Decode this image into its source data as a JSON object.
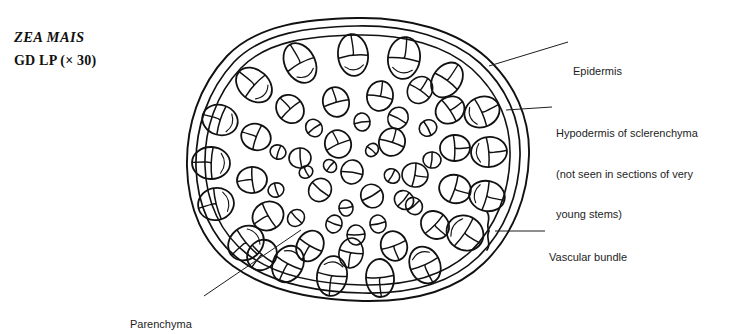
{
  "figure": {
    "title_species": "ZEA MAIS",
    "title_subtitle": "GD LP (× 30)",
    "background_color": "#ffffff",
    "ink_color": "#111111",
    "view": {
      "width": 737,
      "height": 329
    }
  },
  "labels": {
    "epidermis": "Epidermis",
    "hypodermis_line1": "Hypodermis of sclerenchyma",
    "hypodermis_line2": "(not seen in sections of very",
    "hypodermis_line3": "young stems)",
    "vascular_bundle": "Vascular bundle",
    "parenchyma": "Parenchyma"
  },
  "diagram": {
    "type": "botanical-cross-section",
    "outline_rings": 3,
    "bundle_count": 57,
    "outline_center": {
      "cx": 358,
      "cy": 159
    },
    "outline_radii": {
      "rx": 168,
      "ry": 141
    },
    "bundles": [
      {
        "x": 300,
        "y": 63,
        "rx": 15,
        "ry": 21,
        "rot": -28
      },
      {
        "x": 353,
        "y": 55,
        "rx": 15,
        "ry": 21,
        "rot": -6
      },
      {
        "x": 404,
        "y": 58,
        "rx": 16,
        "ry": 21,
        "rot": 8
      },
      {
        "x": 254,
        "y": 85,
        "rx": 15,
        "ry": 20,
        "rot": -48
      },
      {
        "x": 447,
        "y": 80,
        "rx": 14,
        "ry": 19,
        "rot": 36
      },
      {
        "x": 220,
        "y": 120,
        "rx": 15,
        "ry": 18,
        "rot": -72
      },
      {
        "x": 482,
        "y": 112,
        "rx": 15,
        "ry": 18,
        "rot": 66
      },
      {
        "x": 211,
        "y": 163,
        "rx": 16,
        "ry": 19,
        "rot": -88
      },
      {
        "x": 489,
        "y": 152,
        "rx": 15,
        "ry": 18,
        "rot": 85
      },
      {
        "x": 216,
        "y": 204,
        "rx": 16,
        "ry": 18,
        "rot": -104
      },
      {
        "x": 487,
        "y": 196,
        "rx": 15,
        "ry": 18,
        "rot": 104
      },
      {
        "x": 246,
        "y": 243,
        "rx": 16,
        "ry": 19,
        "rot": -130
      },
      {
        "x": 465,
        "y": 233,
        "rx": 17,
        "ry": 19,
        "rot": 124
      },
      {
        "x": 288,
        "y": 264,
        "rx": 15,
        "ry": 19,
        "rot": -152
      },
      {
        "x": 332,
        "y": 276,
        "rx": 15,
        "ry": 20,
        "rot": -172
      },
      {
        "x": 380,
        "y": 278,
        "rx": 14,
        "ry": 19,
        "rot": 176
      },
      {
        "x": 425,
        "y": 265,
        "rx": 15,
        "ry": 19,
        "rot": 156
      },
      {
        "x": 268,
        "y": 216,
        "rx": 14,
        "ry": 16,
        "rot": -120
      },
      {
        "x": 310,
        "y": 246,
        "rx": 13,
        "ry": 16,
        "rot": -150
      },
      {
        "x": 351,
        "y": 253,
        "rx": 12,
        "ry": 15,
        "rot": -170
      },
      {
        "x": 394,
        "y": 246,
        "rx": 13,
        "ry": 15,
        "rot": 160
      },
      {
        "x": 435,
        "y": 225,
        "rx": 13,
        "ry": 15,
        "rot": 134
      },
      {
        "x": 455,
        "y": 189,
        "rx": 14,
        "ry": 16,
        "rot": 108
      },
      {
        "x": 455,
        "y": 148,
        "rx": 13,
        "ry": 15,
        "rot": 88
      },
      {
        "x": 450,
        "y": 110,
        "rx": 13,
        "ry": 15,
        "rot": 56
      },
      {
        "x": 420,
        "y": 90,
        "rx": 12,
        "ry": 14,
        "rot": 34
      },
      {
        "x": 380,
        "y": 96,
        "rx": 13,
        "ry": 15,
        "rot": 10
      },
      {
        "x": 336,
        "y": 102,
        "rx": 13,
        "ry": 15,
        "rot": -16
      },
      {
        "x": 290,
        "y": 109,
        "rx": 13,
        "ry": 15,
        "rot": -42
      },
      {
        "x": 256,
        "y": 137,
        "rx": 13,
        "ry": 15,
        "rot": -70
      },
      {
        "x": 252,
        "y": 180,
        "rx": 13,
        "ry": 15,
        "rot": -96
      },
      {
        "x": 338,
        "y": 144,
        "rx": 13,
        "ry": 14,
        "rot": -24
      },
      {
        "x": 392,
        "y": 142,
        "rx": 13,
        "ry": 14,
        "rot": 18
      },
      {
        "x": 415,
        "y": 175,
        "rx": 12,
        "ry": 13,
        "rot": 100
      },
      {
        "x": 372,
        "y": 196,
        "rx": 11,
        "ry": 12,
        "rot": 150
      },
      {
        "x": 320,
        "y": 190,
        "rx": 11,
        "ry": 12,
        "rot": -140
      },
      {
        "x": 300,
        "y": 158,
        "rx": 10,
        "ry": 11,
        "rot": -95
      },
      {
        "x": 352,
        "y": 172,
        "rx": 11,
        "ry": 12,
        "rot": 8
      },
      {
        "x": 398,
        "y": 118,
        "rx": 10,
        "ry": 11,
        "rot": 28
      },
      {
        "x": 362,
        "y": 122,
        "rx": 8,
        "ry": 9,
        "rot": -8
      },
      {
        "x": 314,
        "y": 128,
        "rx": 8,
        "ry": 9,
        "rot": -36
      },
      {
        "x": 278,
        "y": 152,
        "rx": 7,
        "ry": 8,
        "rot": -72
      },
      {
        "x": 276,
        "y": 190,
        "rx": 7,
        "ry": 8,
        "rot": -108
      },
      {
        "x": 296,
        "y": 218,
        "rx": 8,
        "ry": 9,
        "rot": -134
      },
      {
        "x": 334,
        "y": 224,
        "rx": 8,
        "ry": 9,
        "rot": -160
      },
      {
        "x": 378,
        "y": 224,
        "rx": 8,
        "ry": 9,
        "rot": 168
      },
      {
        "x": 414,
        "y": 206,
        "rx": 8,
        "ry": 9,
        "rot": 140
      },
      {
        "x": 432,
        "y": 160,
        "rx": 8,
        "ry": 9,
        "rot": 96
      },
      {
        "x": 428,
        "y": 128,
        "rx": 8,
        "ry": 9,
        "rot": 62
      },
      {
        "x": 392,
        "y": 176,
        "rx": 7,
        "ry": 8,
        "rot": 120
      },
      {
        "x": 346,
        "y": 208,
        "rx": 7,
        "ry": 8,
        "rot": 172
      },
      {
        "x": 306,
        "y": 172,
        "rx": 6,
        "ry": 7,
        "rot": -118
      },
      {
        "x": 330,
        "y": 166,
        "rx": 6,
        "ry": 7,
        "rot": -50
      },
      {
        "x": 372,
        "y": 150,
        "rx": 6,
        "ry": 7,
        "rot": 40
      },
      {
        "x": 262,
        "y": 255,
        "rx": 14,
        "ry": 16,
        "rot": -140
      },
      {
        "x": 404,
        "y": 200,
        "rx": 9,
        "ry": 10,
        "rot": 130
      },
      {
        "x": 356,
        "y": 235,
        "rx": 9,
        "ry": 10,
        "rot": 178
      }
    ]
  }
}
